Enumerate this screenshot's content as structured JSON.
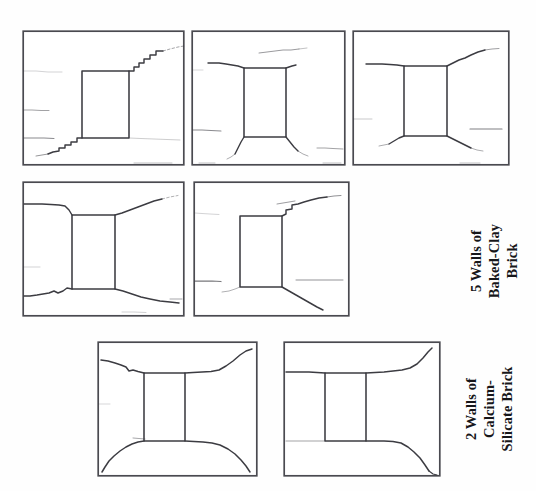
{
  "figure": {
    "background_color": "#ffffff",
    "line_color": "#3a3a3f",
    "frame_color": "#4a4a50",
    "text_color": "#17171a"
  },
  "groups": [
    {
      "id": "baked-clay",
      "label": "5 Walls of\nBaked-Clay\nBrick",
      "wall_count": "5",
      "material": "Baked-Clay Brick",
      "panel_count": 5
    },
    {
      "id": "calcium-silicate",
      "label": "2 Walls of\nCalcium-\nSilicate Brick",
      "wall_count": "2",
      "material": "Calcium-Silicate Brick",
      "panel_count": 2
    }
  ],
  "panels": [
    {
      "id": "panel-1",
      "group": "baked-clay",
      "row": 1,
      "column": 1,
      "opening": {
        "x": 0.37,
        "y": 0.3,
        "w": 0.3,
        "h": 0.5
      },
      "crack_count": 4
    },
    {
      "id": "panel-2",
      "group": "baked-clay",
      "row": 1,
      "column": 2,
      "opening": {
        "x": 0.36,
        "y": 0.3,
        "w": 0.29,
        "h": 0.5
      },
      "crack_count": 5
    },
    {
      "id": "panel-3",
      "group": "baked-clay",
      "row": 1,
      "column": 3,
      "opening": {
        "x": 0.36,
        "y": 0.29,
        "w": 0.29,
        "h": 0.52
      },
      "crack_count": 5
    },
    {
      "id": "panel-4",
      "group": "baked-clay",
      "row": 2,
      "column": 1,
      "opening": {
        "x": 0.36,
        "y": 0.3,
        "w": 0.29,
        "h": 0.52
      },
      "crack_count": 4
    },
    {
      "id": "panel-5",
      "group": "baked-clay",
      "row": 2,
      "column": 2,
      "opening": {
        "x": 0.35,
        "y": 0.3,
        "w": 0.29,
        "h": 0.52
      },
      "crack_count": 5
    },
    {
      "id": "panel-6",
      "group": "calcium-silicate",
      "row": 3,
      "column": 1,
      "opening": {
        "x": 0.35,
        "y": 0.3,
        "w": 0.3,
        "h": 0.52
      },
      "crack_count": 2
    },
    {
      "id": "panel-7",
      "group": "calcium-silicate",
      "row": 3,
      "column": 2,
      "opening": {
        "x": 0.33,
        "y": 0.3,
        "w": 0.31,
        "h": 0.52
      },
      "crack_count": 2
    }
  ]
}
